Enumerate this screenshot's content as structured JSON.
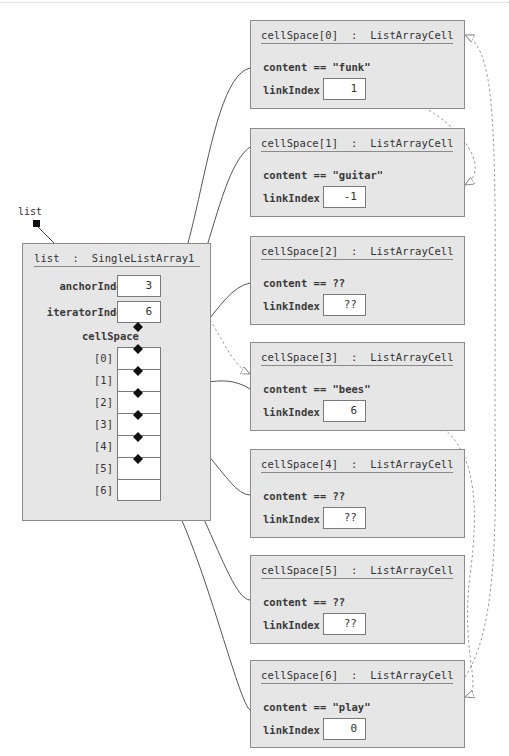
{
  "reference": {
    "label": "list"
  },
  "list_object": {
    "title": "list  :  SingleListArray1",
    "fields": [
      {
        "name": "anchorIndex",
        "value": "3"
      },
      {
        "name": "iteratorIndex",
        "value": "6"
      }
    ],
    "array_label": "cellSpace",
    "slots": [
      "[0]",
      "[1]",
      "[2]",
      "[3]",
      "[4]",
      "[5]",
      "[6]"
    ]
  },
  "cells": [
    {
      "title": "cellSpace[0]  :  ListArrayCell",
      "content": "content == \"funk\"",
      "link_label": "linkIndex",
      "link_value": "1"
    },
    {
      "title": "cellSpace[1]  :  ListArrayCell",
      "content": "content == \"guitar\"",
      "link_label": "linkIndex",
      "link_value": "-1"
    },
    {
      "title": "cellSpace[2]  :  ListArrayCell",
      "content": "content == ??",
      "link_label": "linkIndex",
      "link_value": "??"
    },
    {
      "title": "cellSpace[3]  :  ListArrayCell",
      "content": "content == \"bees\"",
      "link_label": "linkIndex",
      "link_value": "6"
    },
    {
      "title": "cellSpace[4]  :  ListArrayCell",
      "content": "content == ??",
      "link_label": "linkIndex",
      "link_value": "??"
    },
    {
      "title": "cellSpace[5]  :  ListArrayCell",
      "content": "content == ??",
      "link_label": "linkIndex",
      "link_value": "??"
    },
    {
      "title": "cellSpace[6]  :  ListArrayCell",
      "content": "content == \"play\"",
      "link_label": "linkIndex",
      "link_value": "0"
    }
  ],
  "colors": {
    "box_fill": "#e6e6e6",
    "box_border": "#8c8c8c",
    "wire": "#555555",
    "dashed_link": "#9a9a9a"
  }
}
